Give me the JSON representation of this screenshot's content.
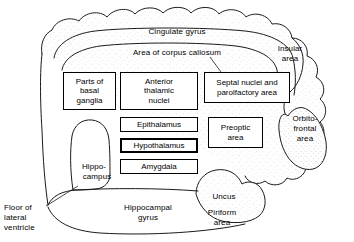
{
  "diagram": {
    "type": "anatomical-schematic",
    "stipple_fill": "#fdfdfd",
    "line_color": "#000000",
    "background": "#ffffff"
  },
  "outer_labels": {
    "cingulate_gyrus": "Cingulate gyrus",
    "corpus_callosum": "Area of corpus callosum",
    "insular_area_line1": "Insular",
    "insular_area_line2": "area",
    "orbito_frontal_line1": "Orbito-",
    "orbito_frontal_line2": "frontal",
    "orbito_frontal_line3": "area",
    "hippocampus_line1": "Hippo-",
    "hippocampus_line2": "campus",
    "hippocampal_gyrus_line1": "Hippocampal",
    "hippocampal_gyrus_line2": "gyrus",
    "uncus": "Uncus",
    "piriform_line1": "Piriform",
    "piriform_line2": "area",
    "floor_line1": "Floor of",
    "floor_line2": "lateral",
    "floor_line3": "ventricle"
  },
  "boxes": [
    {
      "name": "parts-of-basal-ganglia",
      "lines": [
        "Parts of",
        "basal",
        "ganglia"
      ],
      "x": 63,
      "y": 72,
      "w": 53,
      "h": 38,
      "emphasis": false
    },
    {
      "name": "anterior-thalamic-nuclei",
      "lines": [
        "Anterior",
        "thalamic",
        "nuclei"
      ],
      "x": 120,
      "y": 72,
      "w": 78,
      "h": 38,
      "emphasis": false
    },
    {
      "name": "septal-nuclei-and-parolfactory-area",
      "lines": [
        "Septal nuclei and",
        "parolfactory area"
      ],
      "x": 204,
      "y": 72,
      "w": 86,
      "h": 31,
      "emphasis": false
    },
    {
      "name": "epithalamus",
      "lines": [
        "Epithalamus"
      ],
      "x": 120,
      "y": 117,
      "w": 78,
      "h": 15,
      "emphasis": false
    },
    {
      "name": "preoptic-area",
      "lines": [
        "Preoptic",
        "area"
      ],
      "x": 208,
      "y": 117,
      "w": 55,
      "h": 31,
      "emphasis": false
    },
    {
      "name": "hypothalamus",
      "lines": [
        "Hypothalamus"
      ],
      "x": 120,
      "y": 138,
      "w": 78,
      "h": 15,
      "emphasis": true
    },
    {
      "name": "amygdala",
      "lines": [
        "Amygdala"
      ],
      "x": 120,
      "y": 159,
      "w": 78,
      "h": 15,
      "emphasis": false
    }
  ]
}
